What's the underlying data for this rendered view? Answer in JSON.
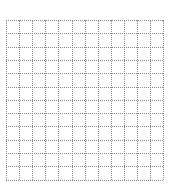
{
  "grid": {
    "columns": 12,
    "rows": 12,
    "cell_width": 13.1,
    "cell_height": 13.3,
    "line_style": "dotted",
    "line_color": "#8a8a8a",
    "background": "#ffffff"
  }
}
